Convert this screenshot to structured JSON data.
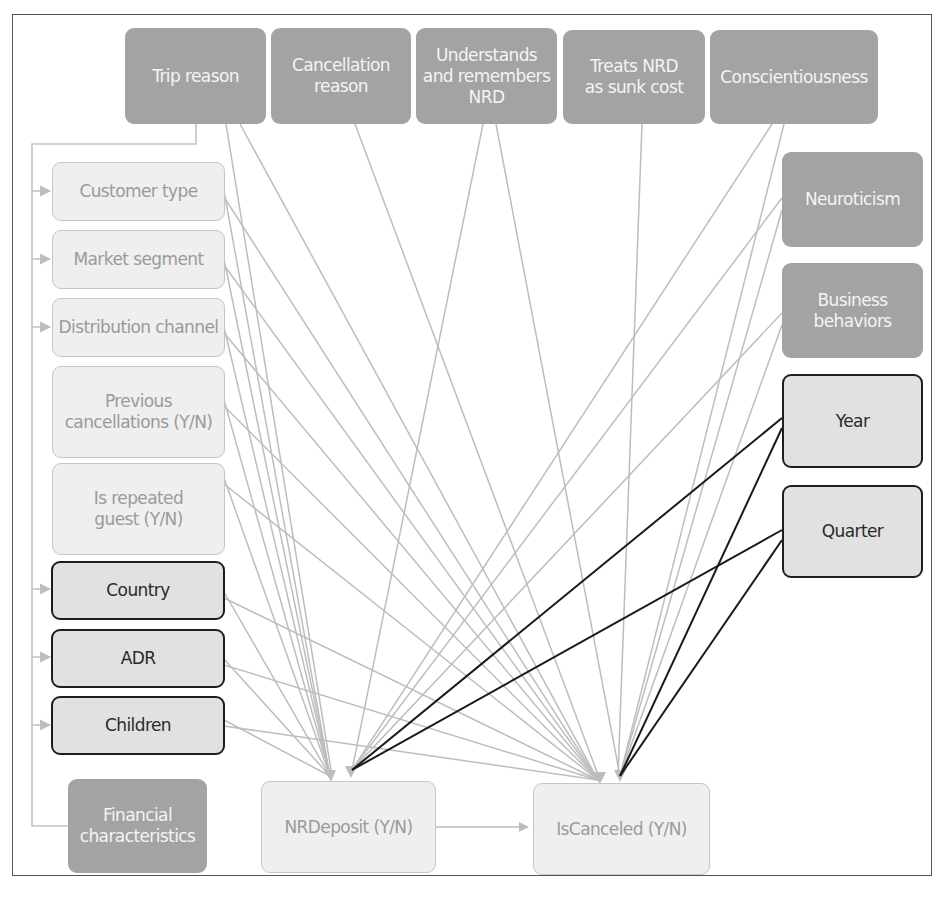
{
  "diagram": {
    "type": "causal-dag",
    "colors": {
      "latent_fill": "#a3a3a3",
      "observed_fill": "#efefef",
      "key_fill": "#e1e1e1",
      "key_border": "#1e1e1e",
      "edge_gray": "#bdbdbd",
      "edge_black": "#1a1a1a"
    },
    "nodes": [
      {
        "id": "trip_reason",
        "label": "Trip reason",
        "style": "latent"
      },
      {
        "id": "cancellation_reason",
        "label": "Cancellation\nreason",
        "style": "latent"
      },
      {
        "id": "understands_nrd",
        "label": "Understands\nand remembers\nNRD",
        "style": "latent"
      },
      {
        "id": "treats_nrd_sunk",
        "label": "Treats NRD\nas sunk cost",
        "style": "latent"
      },
      {
        "id": "conscientiousness",
        "label": "Conscientiousness",
        "style": "latent"
      },
      {
        "id": "neuroticism",
        "label": "Neuroticism",
        "style": "latent"
      },
      {
        "id": "business_behaviors",
        "label": "Business\nbehaviors",
        "style": "latent"
      },
      {
        "id": "customer_type",
        "label": "Customer type",
        "style": "observed"
      },
      {
        "id": "market_segment",
        "label": "Market segment",
        "style": "observed"
      },
      {
        "id": "distribution_channel",
        "label": "Distribution channel",
        "style": "observed"
      },
      {
        "id": "previous_cancellations",
        "label": "Previous\ncancellations (Y/N)",
        "style": "observed"
      },
      {
        "id": "is_repeated_guest",
        "label": "Is repeated\nguest (Y/N)",
        "style": "observed"
      },
      {
        "id": "country",
        "label": "Country",
        "style": "key"
      },
      {
        "id": "adr",
        "label": "ADR",
        "style": "key"
      },
      {
        "id": "children",
        "label": "Children",
        "style": "key"
      },
      {
        "id": "year",
        "label": "Year",
        "style": "key"
      },
      {
        "id": "quarter",
        "label": "Quarter",
        "style": "key"
      },
      {
        "id": "financial_characteristics",
        "label": "Financial\ncharacteristics",
        "style": "latent"
      },
      {
        "id": "nrdeposit",
        "label": "NRDeposit (Y/N)",
        "style": "observed"
      },
      {
        "id": "iscanceled",
        "label": "IsCanceled (Y/N)",
        "style": "observed"
      }
    ],
    "edges": [
      {
        "from": "trip_reason",
        "to": "nrdeposit",
        "color": "gray"
      },
      {
        "from": "trip_reason",
        "to": "iscanceled",
        "color": "gray"
      },
      {
        "from": "cancellation_reason",
        "to": "iscanceled",
        "color": "gray"
      },
      {
        "from": "understands_nrd",
        "to": "nrdeposit",
        "color": "gray"
      },
      {
        "from": "understands_nrd",
        "to": "iscanceled",
        "color": "gray"
      },
      {
        "from": "treats_nrd_sunk",
        "to": "iscanceled",
        "color": "gray"
      },
      {
        "from": "conscientiousness",
        "to": "nrdeposit",
        "color": "gray"
      },
      {
        "from": "conscientiousness",
        "to": "iscanceled",
        "color": "gray"
      },
      {
        "from": "neuroticism",
        "to": "nrdeposit",
        "color": "gray"
      },
      {
        "from": "neuroticism",
        "to": "iscanceled",
        "color": "gray"
      },
      {
        "from": "business_behaviors",
        "to": "nrdeposit",
        "color": "gray"
      },
      {
        "from": "business_behaviors",
        "to": "iscanceled",
        "color": "gray"
      },
      {
        "from": "customer_type",
        "to": "nrdeposit",
        "color": "gray"
      },
      {
        "from": "customer_type",
        "to": "iscanceled",
        "color": "gray"
      },
      {
        "from": "market_segment",
        "to": "nrdeposit",
        "color": "gray"
      },
      {
        "from": "market_segment",
        "to": "iscanceled",
        "color": "gray"
      },
      {
        "from": "distribution_channel",
        "to": "nrdeposit",
        "color": "gray"
      },
      {
        "from": "distribution_channel",
        "to": "iscanceled",
        "color": "gray"
      },
      {
        "from": "previous_cancellations",
        "to": "nrdeposit",
        "color": "gray"
      },
      {
        "from": "previous_cancellations",
        "to": "iscanceled",
        "color": "gray"
      },
      {
        "from": "is_repeated_guest",
        "to": "nrdeposit",
        "color": "gray"
      },
      {
        "from": "is_repeated_guest",
        "to": "iscanceled",
        "color": "gray"
      },
      {
        "from": "country",
        "to": "nrdeposit",
        "color": "gray"
      },
      {
        "from": "country",
        "to": "iscanceled",
        "color": "gray"
      },
      {
        "from": "adr",
        "to": "nrdeposit",
        "color": "gray"
      },
      {
        "from": "adr",
        "to": "iscanceled",
        "color": "gray"
      },
      {
        "from": "children",
        "to": "nrdeposit",
        "color": "gray"
      },
      {
        "from": "children",
        "to": "iscanceled",
        "color": "gray"
      },
      {
        "from": "year",
        "to": "nrdeposit",
        "color": "black"
      },
      {
        "from": "year",
        "to": "iscanceled",
        "color": "black"
      },
      {
        "from": "quarter",
        "to": "nrdeposit",
        "color": "black"
      },
      {
        "from": "quarter",
        "to": "iscanceled",
        "color": "black"
      },
      {
        "from": "nrdeposit",
        "to": "iscanceled",
        "color": "gray"
      },
      {
        "from": "trip_reason",
        "to": "customer_type",
        "color": "gray",
        "via": "left-bus"
      },
      {
        "from": "trip_reason",
        "to": "market_segment",
        "color": "gray",
        "via": "left-bus"
      },
      {
        "from": "trip_reason",
        "to": "distribution_channel",
        "color": "gray",
        "via": "left-bus"
      },
      {
        "from": "trip_reason",
        "to": "country",
        "color": "gray",
        "via": "left-bus"
      },
      {
        "from": "trip_reason",
        "to": "adr",
        "color": "gray",
        "via": "left-bus"
      },
      {
        "from": "trip_reason",
        "to": "children",
        "color": "gray",
        "via": "left-bus"
      },
      {
        "from": "financial_characteristics",
        "to": "left-bus",
        "color": "gray"
      }
    ]
  }
}
